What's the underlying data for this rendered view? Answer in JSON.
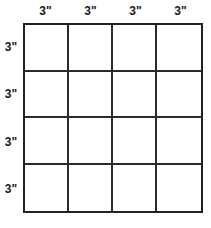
{
  "diagram": {
    "type": "grid-dimension-diagram",
    "title": "",
    "grid": {
      "columns": 4,
      "rows": 4,
      "cell_count": 16,
      "line_color": "#2b2b2b",
      "border_color": "#222222",
      "fill_color": "#ffffff"
    },
    "unit": "inches",
    "column_labels": [
      "3\"",
      "3\"",
      "3\"",
      "3\""
    ],
    "row_labels": [
      "3\"",
      "3\"",
      "3\"",
      "3\""
    ],
    "cells": [
      {
        "row": 1,
        "col": 1,
        "label": ""
      },
      {
        "row": 1,
        "col": 2,
        "label": ""
      },
      {
        "row": 1,
        "col": 3,
        "label": ""
      },
      {
        "row": 1,
        "col": 4,
        "label": ""
      },
      {
        "row": 2,
        "col": 1,
        "label": ""
      },
      {
        "row": 2,
        "col": 2,
        "label": ""
      },
      {
        "row": 2,
        "col": 3,
        "label": ""
      },
      {
        "row": 2,
        "col": 4,
        "label": ""
      },
      {
        "row": 3,
        "col": 1,
        "label": ""
      },
      {
        "row": 3,
        "col": 2,
        "label": ""
      },
      {
        "row": 3,
        "col": 3,
        "label": ""
      },
      {
        "row": 3,
        "col": 4,
        "label": ""
      },
      {
        "row": 4,
        "col": 1,
        "label": ""
      },
      {
        "row": 4,
        "col": 2,
        "label": ""
      },
      {
        "row": 4,
        "col": 3,
        "label": ""
      },
      {
        "row": 4,
        "col": 4,
        "label": ""
      }
    ]
  }
}
